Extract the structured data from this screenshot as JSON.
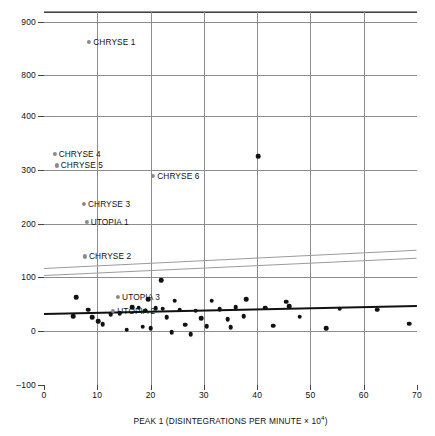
{
  "chart_data": {
    "type": "scatter",
    "title": "",
    "xlabel": "PEAK 1 (DISINTEGRATIONS PER MINUTE × 10⁴)",
    "xlabel_base": "PEAK 1 (DISINTEGRATIONS PER MINUTE × 10",
    "xlabel_exp": "4",
    "xlabel_tail": ")",
    "ylabel": "PEAK 2 (DISINTEGRATIONS PER MINUTE)",
    "xlim": [
      0,
      70
    ],
    "xticks": [
      0,
      10,
      20,
      30,
      40,
      50,
      60,
      70
    ],
    "yticks": [
      -100,
      0,
      100,
      200,
      300,
      400,
      800,
      900
    ],
    "y_axis_break": {
      "below": 400,
      "above": 800
    },
    "grid": true,
    "legend": "none",
    "labeled_points": [
      {
        "label": "CHRYSE 1",
        "x": 8.5,
        "y": 862,
        "color": "#8a8a8a"
      },
      {
        "label": "CHRYSE 4",
        "x": 2.0,
        "y": 330,
        "color": "#8a8a8a"
      },
      {
        "label": "CHRYSE 5",
        "x": 2.4,
        "y": 308,
        "color": "#8a8a8a"
      },
      {
        "label": "CHRYSE 6",
        "x": 20.5,
        "y": 288,
        "color": "#8a8a8a"
      },
      {
        "label": "CHRYSE 3",
        "x": 7.5,
        "y": 236,
        "color": "#8a8a8a"
      },
      {
        "label": "UTOPIA 1",
        "x": 8.0,
        "y": 203,
        "color": "#8a8a8a"
      },
      {
        "label": "CHRYSE 2",
        "x": 7.7,
        "y": 139,
        "color": "#8a8a8a"
      },
      {
        "label": "UTOPIA 3",
        "x": 13.9,
        "y": 63,
        "color": "#8a8a8a"
      },
      {
        "label": "UTOPIA 2",
        "x": 13.0,
        "y": 38,
        "color": "#8a8a8a"
      }
    ],
    "points": [
      {
        "x": 40.2,
        "y": 325
      },
      {
        "x": 22.0,
        "y": 95
      },
      {
        "x": 6.0,
        "y": 63
      },
      {
        "x": 19.5,
        "y": 60
      },
      {
        "x": 24.5,
        "y": 57
      },
      {
        "x": 31.5,
        "y": 57
      },
      {
        "x": 38.0,
        "y": 60
      },
      {
        "x": 45.5,
        "y": 55
      },
      {
        "x": 46.0,
        "y": 47
      },
      {
        "x": 16.5,
        "y": 45
      },
      {
        "x": 17.8,
        "y": 44
      },
      {
        "x": 21.0,
        "y": 43
      },
      {
        "x": 22.3,
        "y": 42
      },
      {
        "x": 25.5,
        "y": 40
      },
      {
        "x": 28.5,
        "y": 38
      },
      {
        "x": 33.0,
        "y": 41
      },
      {
        "x": 36.0,
        "y": 45
      },
      {
        "x": 41.5,
        "y": 44
      },
      {
        "x": 55.5,
        "y": 42
      },
      {
        "x": 62.5,
        "y": 40
      },
      {
        "x": 12.5,
        "y": 32
      },
      {
        "x": 14.2,
        "y": 34
      },
      {
        "x": 5.5,
        "y": 28
      },
      {
        "x": 9.0,
        "y": 26
      },
      {
        "x": 10.2,
        "y": 19
      },
      {
        "x": 23.0,
        "y": 26
      },
      {
        "x": 29.5,
        "y": 24
      },
      {
        "x": 34.5,
        "y": 22
      },
      {
        "x": 37.5,
        "y": 28
      },
      {
        "x": 48.0,
        "y": 27
      },
      {
        "x": 11.0,
        "y": 13
      },
      {
        "x": 18.5,
        "y": 8
      },
      {
        "x": 20.0,
        "y": 6
      },
      {
        "x": 26.5,
        "y": 12
      },
      {
        "x": 30.5,
        "y": 9
      },
      {
        "x": 35.0,
        "y": 7
      },
      {
        "x": 43.0,
        "y": 10
      },
      {
        "x": 53.0,
        "y": 6
      },
      {
        "x": 68.5,
        "y": 14
      },
      {
        "x": 24.0,
        "y": -2
      },
      {
        "x": 27.5,
        "y": -6
      },
      {
        "x": 15.5,
        "y": 3
      },
      {
        "x": 8.3,
        "y": 40
      },
      {
        "x": 19.0,
        "y": 38
      }
    ],
    "regression_line": {
      "x0": 0,
      "y0": 33,
      "x1": 70,
      "y1": 48
    },
    "confidence_bands": [
      {
        "x0": 0,
        "y0": 118,
        "x1": 70,
        "y1": 152
      },
      {
        "x0": 0,
        "y0": 104,
        "x1": 70,
        "y1": 136
      }
    ]
  }
}
